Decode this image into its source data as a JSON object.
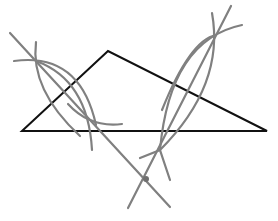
{
  "diagram": {
    "type": "geometric-construction",
    "colors": {
      "triangle": "#111111",
      "construction": "#808080",
      "background": "#ffffff"
    },
    "triangle": {
      "vertices": [
        {
          "name": "A",
          "x": 22,
          "y": 131
        },
        {
          "name": "B",
          "x": 108,
          "y": 51
        },
        {
          "name": "C",
          "x": 267,
          "y": 131
        }
      ]
    },
    "bisectors": [
      {
        "side": "AB",
        "from": {
          "x": 10,
          "y": 33
        },
        "to": {
          "x": 170,
          "y": 207
        }
      },
      {
        "side": "BC",
        "from": {
          "x": 231,
          "y": 6
        },
        "to": {
          "x": 128,
          "y": 208
        }
      }
    ],
    "circumcenter": {
      "x": 146,
      "y": 179
    }
  }
}
